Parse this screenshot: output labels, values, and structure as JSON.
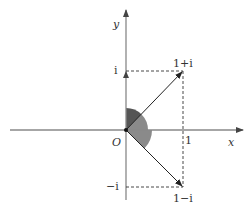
{
  "diagram": {
    "axes": {
      "x_label": "x",
      "y_label": "y",
      "origin_label": "O"
    },
    "ticks": {
      "x_one": "1",
      "y_i": "i",
      "y_neg_i": "−i"
    },
    "points": [
      {
        "label": "1+i",
        "x": 1,
        "y": 1
      },
      {
        "label": "1−i",
        "x": 1,
        "y": -1
      }
    ],
    "colors": {
      "axis": "#888888",
      "vector": "#222222",
      "dashed": "#333333",
      "angle_dark": "#555555",
      "angle_light": "#8a8a8a"
    }
  }
}
